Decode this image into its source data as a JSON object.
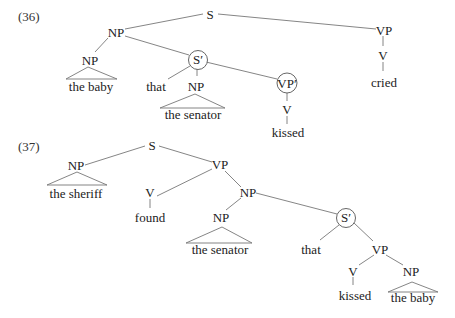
{
  "trees": [
    {
      "label": "(36)",
      "nodes": {
        "S": "S",
        "NP_top": "NP",
        "NP_baby": "NP",
        "baby_text": "the baby",
        "S_bar": "S′",
        "that": "that",
        "NP_senator": "NP",
        "senator_text": "the senator",
        "VP_bar": "VP′",
        "V_kissed": "V",
        "kissed": "kissed",
        "VP_main": "VP",
        "V_cried": "V",
        "cried": "cried"
      },
      "circled": [
        "S′",
        "VP′"
      ]
    },
    {
      "label": "(37)",
      "nodes": {
        "S": "S",
        "NP_sheriff": "NP",
        "sheriff_text": "the sheriff",
        "VP": "VP",
        "V_found": "V",
        "found": "found",
        "NP_complex": "NP",
        "NP_senator": "NP",
        "senator_text": "the senator",
        "S_bar": "S′",
        "that": "that",
        "VP_inner": "VP",
        "V_kissed": "V",
        "kissed": "kissed",
        "NP_baby": "NP",
        "baby_text": "the baby"
      },
      "circled": [
        "S′"
      ]
    }
  ]
}
